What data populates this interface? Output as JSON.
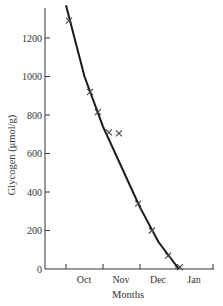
{
  "chart_data": {
    "type": "scatter",
    "title": "",
    "xlabel": "Months",
    "ylabel": "Glycogen (μmol/g)",
    "x_ticks": [
      "Oct",
      "Nov",
      "Dec",
      "Jan"
    ],
    "y_ticks": [
      0,
      200,
      400,
      600,
      800,
      1000,
      1200
    ],
    "ylim": [
      0,
      1380
    ],
    "grid": false,
    "legend": null,
    "series": [
      {
        "name": "observed",
        "marker": "x",
        "points": [
          {
            "x": "early Oct",
            "month_offset": 0.08,
            "y": 1290
          },
          {
            "x": "mid Oct",
            "month_offset": 0.65,
            "y": 920
          },
          {
            "x": "late Oct",
            "month_offset": 0.86,
            "y": 815
          },
          {
            "x": "early Nov",
            "month_offset": 1.16,
            "y": 710
          },
          {
            "x": "early Nov",
            "month_offset": 1.43,
            "y": 705
          },
          {
            "x": "late Nov",
            "month_offset": 1.95,
            "y": 340
          },
          {
            "x": "early Dec",
            "month_offset": 2.32,
            "y": 200
          },
          {
            "x": "mid Dec",
            "month_offset": 2.76,
            "y": 70
          },
          {
            "x": "late Dec",
            "month_offset": 3.08,
            "y": 10
          }
        ]
      },
      {
        "name": "fitted curve",
        "type": "line",
        "points": [
          {
            "month_offset": 0.0,
            "y": 1370
          },
          {
            "month_offset": 0.5,
            "y": 1000
          },
          {
            "month_offset": 1.0,
            "y": 740
          },
          {
            "month_offset": 1.5,
            "y": 530
          },
          {
            "month_offset": 2.0,
            "y": 320
          },
          {
            "month_offset": 2.5,
            "y": 140
          },
          {
            "month_offset": 3.05,
            "y": 0
          }
        ]
      }
    ]
  }
}
